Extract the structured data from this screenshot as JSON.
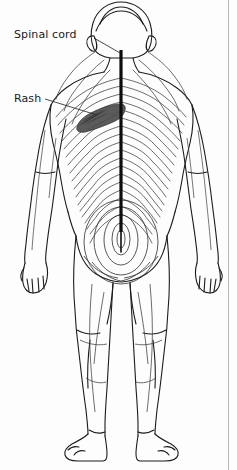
{
  "figure": {
    "view": "posterior",
    "width": 237,
    "height": 470,
    "background_color": "#fdfdfd",
    "border_color": "#b8b8b8"
  },
  "labels": {
    "spinal_cord": {
      "text": "Spinal cord",
      "x": 14,
      "y": 29,
      "leader_from": [
        97,
        38
      ],
      "leader_to": [
        118,
        52
      ]
    },
    "rash": {
      "text": "Rash",
      "x": 14,
      "y": 93,
      "leader_from": [
        47,
        99
      ],
      "leader_to": [
        95,
        114
      ]
    }
  },
  "colors": {
    "outline": "#1b1b1b",
    "dermatome_line": "#3c3c3c",
    "spinal_cord": "#0d0d0d",
    "rash_fill": "#5a5a5a",
    "rash_stroke": "#3a3a3a",
    "label_text": "#1b1b1b",
    "leader_line": "#2a2a2a"
  },
  "anatomy": {
    "spinal_cord": {
      "name": "spinal-cord",
      "description": "Thick vertical black line from base of skull down to sacrum",
      "x": 121,
      "y_top": 50,
      "y_bottom": 232,
      "stroke_width": 3.2
    },
    "rash": {
      "name": "rash-patch",
      "description": "Dark shaded dermatomal band on left mid-back following a thoracic dermatome",
      "side": "left",
      "region": "mid-back thoracic dermatome",
      "bounds": [
        75,
        104,
        48,
        26
      ]
    },
    "parts": [
      {
        "name": "head",
        "label": "Head (posterior)"
      },
      {
        "name": "left-ear",
        "label": "Left ear"
      },
      {
        "name": "right-ear",
        "label": "Right ear"
      },
      {
        "name": "neck",
        "label": "Neck"
      },
      {
        "name": "torso",
        "label": "Torso / back"
      },
      {
        "name": "left-arm",
        "label": "Left arm"
      },
      {
        "name": "right-arm",
        "label": "Right arm"
      },
      {
        "name": "left-hand",
        "label": "Left hand"
      },
      {
        "name": "right-hand",
        "label": "Right hand"
      },
      {
        "name": "buttocks",
        "label": "Buttocks / sacral region"
      },
      {
        "name": "left-leg",
        "label": "Left leg"
      },
      {
        "name": "right-leg",
        "label": "Right leg"
      },
      {
        "name": "left-foot",
        "label": "Left foot"
      },
      {
        "name": "right-foot",
        "label": "Right foot"
      }
    ],
    "dermatome_bands": {
      "name": "dermatome-bands",
      "description": "Curved horizontal bands sweeping laterally from the spine across the back",
      "count": 22
    },
    "sacral_rings": {
      "name": "sacral-dermatome-rings",
      "description": "Concentric oval rings centred on the sacral region",
      "count": 5
    }
  }
}
